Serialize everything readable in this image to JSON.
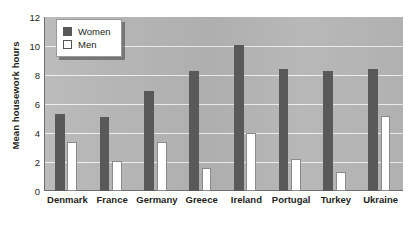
{
  "chart_data": {
    "type": "bar",
    "title": "",
    "subtitle": "",
    "xlabel": "",
    "ylabel": "Mean housework hours",
    "ylim": [
      0,
      12
    ],
    "yticks": [
      0,
      2,
      4,
      6,
      8,
      10,
      12
    ],
    "grid": true,
    "legend_position": "top-left",
    "categories": [
      "Denmark",
      "France",
      "Germany",
      "Greece",
      "Ireland",
      "Portugal",
      "Turkey",
      "Ukraine"
    ],
    "series": [
      {
        "name": "Women",
        "color": "#595959",
        "values": [
          5.3,
          5.1,
          6.9,
          8.3,
          10.1,
          8.4,
          8.3,
          8.4
        ]
      },
      {
        "name": "Men",
        "color": "#ffffff",
        "values": [
          3.4,
          2.1,
          3.4,
          1.6,
          4.0,
          2.2,
          1.3,
          5.2
        ]
      }
    ]
  },
  "legend": {
    "items": [
      {
        "label": "Women"
      },
      {
        "label": "Men"
      }
    ]
  },
  "colors": {
    "plot_background": "#b4b4b4",
    "gridline": "#f2f2f2",
    "women_bar": "#595959",
    "men_bar": "#ffffff",
    "axis": "#6e6e6e",
    "text": "#231f20"
  }
}
